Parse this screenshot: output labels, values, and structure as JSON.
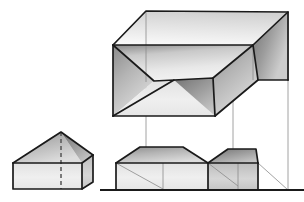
{
  "figure": {
    "type": "technical-line-drawing",
    "canvas": {
      "width": 304,
      "height": 202,
      "background": "#ffffff"
    },
    "style": {
      "outline_color": "#1a1a1a",
      "outline_width": 1.6,
      "thin_line_color": "#8a8a8a",
      "thin_line_width": 0.7,
      "hidden_line_color": "#555555",
      "hidden_line_dash": "4 3",
      "ground_line_color": "#1a1a1a",
      "ground_line_width": 1.8,
      "fill_light": "#f0f0f0",
      "fill_mid": "#cfcfcf",
      "fill_dark": "#9a9a9a",
      "fill_darker": "#7d7d7d"
    },
    "parts": [
      {
        "name": "reference-prism",
        "label": "small gable prism (left)",
        "faces": [
          {
            "name": "front-wall",
            "points": "13,163 82,163 82,189 13,189",
            "shade": "light-vertical"
          },
          {
            "name": "right-wall",
            "points": "82,163 93,155 93,182 82,189",
            "shade": "mid-vertical"
          },
          {
            "name": "roof-left-slope",
            "points": "13,163 50,138 61,132 82,163",
            "shade": "mid-diagonal"
          },
          {
            "name": "roof-right-slope",
            "points": "61,132 93,155 82,163",
            "shade": "dark-diagonal"
          }
        ],
        "hidden_edges": [
          "61,132 61,189"
        ],
        "visible_edges": [
          "13,163 82,163",
          "82,163 93,155",
          "13,163 61,132",
          "61,132 93,155",
          "13,163 13,189",
          "13,189 82,189",
          "82,189 93,182",
          "93,155 93,182",
          "82,163 82,189"
        ]
      },
      {
        "name": "pictorial-view",
        "label": "axonometric hip-roof solid inside bounding box",
        "faces": [
          {
            "name": "box-top",
            "points": "113,45 146,11 288,12 253,45",
            "shade": "light-top"
          },
          {
            "name": "roof-left-hip",
            "points": "113,45 113,116 154,81",
            "shade": "mid-diagonal"
          },
          {
            "name": "roof-back-slope",
            "points": "113,45 253,45 213,78 174,80 154,81",
            "shade": "light-diagonal"
          },
          {
            "name": "roof-front-slope-left",
            "points": "113,116 154,81 174,80 215,116",
            "shade": "light-vertical"
          },
          {
            "name": "step-riser",
            "points": "174,80 213,78 215,116",
            "shade": "dark-diagonal"
          },
          {
            "name": "step-top",
            "points": "213,78 253,45 258,80 215,116",
            "shade": "mid-diagonal"
          },
          {
            "name": "roof-right-hip",
            "points": "253,45 288,12 288,80 258,80",
            "shade": "darker-diagonal"
          }
        ],
        "visible_edges": [
          "113,45 146,11",
          "146,11 288,12",
          "288,12 288,80",
          "113,45 253,45",
          "253,45 288,12",
          "113,45 113,116",
          "113,116 215,116",
          "113,45 154,81",
          "154,81 174,80",
          "174,80 113,116",
          "174,80 213,78",
          "213,78 215,116",
          "215,116 174,80",
          "213,78 253,45",
          "253,45 258,80",
          "258,80 215,116",
          "258,80 288,80"
        ],
        "thin_edges": [
          "146,11 146,82",
          "288,12 288,190",
          "253,45 253,80"
        ]
      },
      {
        "name": "elevation-view",
        "label": "front elevation of hip-roof solid",
        "faces": [
          {
            "name": "left-wall",
            "points": "116,163 208,163 208,189 116,189",
            "shade": "light-vertical"
          },
          {
            "name": "left-roof",
            "points": "116,163 140,147 183,147 208,163",
            "shade": "mid-diagonal"
          },
          {
            "name": "right-wall",
            "points": "208,163 258,163 258,189 208,189",
            "shade": "mid-vertical"
          },
          {
            "name": "right-roof",
            "points": "208,163 228,149 256,149 258,163",
            "shade": "dark-diagonal"
          }
        ],
        "visible_edges": [
          "116,163 208,163",
          "208,163 258,163",
          "116,163 140,147",
          "140,147 183,147",
          "183,147 208,163",
          "208,163 228,149",
          "228,149 256,149",
          "256,149 258,163",
          "116,163 116,189",
          "208,163 208,189",
          "258,163 258,189"
        ],
        "thin_edges": [
          "116,163 163,189",
          "208,163 238,186",
          "258,163 288,190",
          "163,163 163,190"
        ]
      },
      {
        "name": "projection-lines",
        "label": "vertical projectors linking pictorial and elevation views",
        "lines": [
          "146,11 146,190",
          "233,82 233,190",
          "288,12 288,190"
        ]
      },
      {
        "name": "ground-line",
        "label": "ground / base reference line",
        "line": "100,190 304,190"
      }
    ]
  }
}
